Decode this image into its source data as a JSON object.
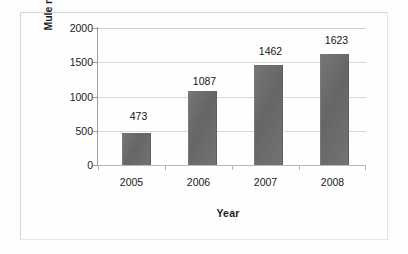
{
  "chart_data": {
    "type": "bar",
    "title": "",
    "xlabel": "Year",
    "ylabel": "Mule recruitment advert",
    "categories": [
      "2005",
      "2006",
      "2007",
      "2008"
    ],
    "values": [
      473,
      1087,
      1462,
      1623
    ],
    "data_labels": [
      "473",
      "1087",
      "1462",
      "1623"
    ],
    "ylim": [
      0,
      2000
    ],
    "ytick_labels": [
      "2000",
      "1500",
      "1000",
      "500",
      "0"
    ],
    "ytick_values": [
      2000,
      1500,
      1000,
      500,
      0
    ],
    "grid": true,
    "legend": false,
    "series": [
      {
        "name": "Mule recruitment advert",
        "values": [
          473,
          1087,
          1462,
          1623
        ],
        "color": "#6b6b6b"
      }
    ]
  },
  "figure": {
    "bar_color": "#6b6b6b",
    "gridline_color": "#dadada",
    "axis_color": "#9c9c9c",
    "frame_color": "#d6d6d6",
    "background": "#fefefe"
  }
}
